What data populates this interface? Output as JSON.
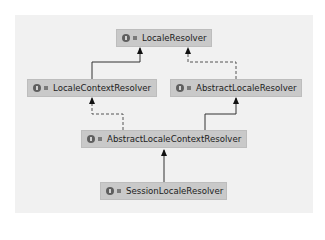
{
  "diagram": {
    "title": "",
    "nodes": [
      {
        "id": "locale-resolver",
        "label": "LocaleResolver",
        "kind": "interface"
      },
      {
        "id": "locale-context-resolver",
        "label": "LocaleContextResolver",
        "kind": "interface"
      },
      {
        "id": "abstract-locale-resolver",
        "label": "AbstractLocaleResolver",
        "kind": "abstract-class"
      },
      {
        "id": "abstract-locale-context-resolver",
        "label": "AbstractLocaleContextResolver",
        "kind": "abstract-class"
      },
      {
        "id": "session-locale-resolver",
        "label": "SessionLocaleResolver",
        "kind": "class"
      }
    ],
    "edges": [
      {
        "from": "locale-context-resolver",
        "to": "locale-resolver",
        "type": "extends",
        "style": "solid"
      },
      {
        "from": "abstract-locale-resolver",
        "to": "locale-resolver",
        "type": "implements",
        "style": "dashed"
      },
      {
        "from": "abstract-locale-context-resolver",
        "to": "locale-context-resolver",
        "type": "implements",
        "style": "dashed"
      },
      {
        "from": "abstract-locale-context-resolver",
        "to": "abstract-locale-resolver",
        "type": "extends",
        "style": "solid"
      },
      {
        "from": "session-locale-resolver",
        "to": "abstract-locale-context-resolver",
        "type": "extends",
        "style": "solid"
      }
    ]
  }
}
